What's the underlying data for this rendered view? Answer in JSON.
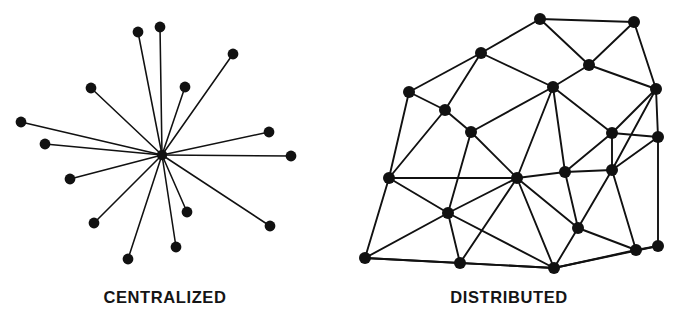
{
  "figure": {
    "background_color": "#ffffff",
    "ink_color": "#111111"
  },
  "panels": [
    {
      "id": "centralized",
      "caption": "CENTRALIZED",
      "type": "star",
      "node_count": 17,
      "edge_count": 16,
      "hub": {
        "x": 162,
        "y": 155,
        "r": 5.2
      },
      "leaf_radius": 5.4,
      "leaves": [
        {
          "x": 138,
          "y": 32
        },
        {
          "x": 160,
          "y": 27
        },
        {
          "x": 233,
          "y": 54
        },
        {
          "x": 185,
          "y": 87
        },
        {
          "x": 91,
          "y": 88
        },
        {
          "x": 269,
          "y": 132
        },
        {
          "x": 21,
          "y": 122
        },
        {
          "x": 45,
          "y": 144
        },
        {
          "x": 291,
          "y": 156
        },
        {
          "x": 70,
          "y": 179
        },
        {
          "x": 94,
          "y": 223
        },
        {
          "x": 187,
          "y": 212
        },
        {
          "x": 270,
          "y": 226
        },
        {
          "x": 128,
          "y": 259
        },
        {
          "x": 176,
          "y": 247
        }
      ]
    },
    {
      "id": "distributed",
      "caption": "DISTRIBUTED",
      "type": "mesh",
      "node_count": 26,
      "edge_count": 57,
      "node_radius": 6.0,
      "nodes": [
        {
          "id": 0,
          "x": 202,
          "y": 19
        },
        {
          "id": 1,
          "x": 296,
          "y": 22
        },
        {
          "id": 2,
          "x": 143,
          "y": 53
        },
        {
          "id": 3,
          "x": 251,
          "y": 65
        },
        {
          "id": 4,
          "x": 71,
          "y": 92
        },
        {
          "id": 5,
          "x": 215,
          "y": 87
        },
        {
          "id": 6,
          "x": 318,
          "y": 89
        },
        {
          "id": 7,
          "x": 107,
          "y": 110
        },
        {
          "id": 8,
          "x": 133,
          "y": 132
        },
        {
          "id": 9,
          "x": 320,
          "y": 137
        },
        {
          "id": 10,
          "x": 274,
          "y": 133
        },
        {
          "id": 11,
          "x": 51,
          "y": 178
        },
        {
          "id": 12,
          "x": 179,
          "y": 178
        },
        {
          "id": 13,
          "x": 227,
          "y": 172
        },
        {
          "id": 14,
          "x": 274,
          "y": 170
        },
        {
          "id": 15,
          "x": 110,
          "y": 213
        },
        {
          "id": 16,
          "x": 240,
          "y": 228
        },
        {
          "id": 17,
          "x": 27,
          "y": 258
        },
        {
          "id": 18,
          "x": 122,
          "y": 263
        },
        {
          "id": 19,
          "x": 216,
          "y": 268
        },
        {
          "id": 20,
          "x": 298,
          "y": 250
        },
        {
          "id": 21,
          "x": 320,
          "y": 246
        }
      ],
      "edges": [
        [
          0,
          1
        ],
        [
          0,
          2
        ],
        [
          0,
          3
        ],
        [
          1,
          3
        ],
        [
          1,
          6
        ],
        [
          2,
          4
        ],
        [
          2,
          5
        ],
        [
          2,
          7
        ],
        [
          3,
          5
        ],
        [
          3,
          6
        ],
        [
          4,
          7
        ],
        [
          4,
          11
        ],
        [
          5,
          10
        ],
        [
          5,
          12
        ],
        [
          5,
          8
        ],
        [
          6,
          9
        ],
        [
          6,
          10
        ],
        [
          6,
          14
        ],
        [
          7,
          8
        ],
        [
          7,
          11
        ],
        [
          8,
          12
        ],
        [
          8,
          15
        ],
        [
          9,
          14
        ],
        [
          9,
          21
        ],
        [
          10,
          13
        ],
        [
          10,
          14
        ],
        [
          11,
          12
        ],
        [
          11,
          15
        ],
        [
          11,
          17
        ],
        [
          12,
          13
        ],
        [
          12,
          15
        ],
        [
          12,
          16
        ],
        [
          12,
          19
        ],
        [
          13,
          14
        ],
        [
          13,
          16
        ],
        [
          14,
          16
        ],
        [
          14,
          20
        ],
        [
          15,
          17
        ],
        [
          15,
          18
        ],
        [
          15,
          19
        ],
        [
          16,
          19
        ],
        [
          16,
          20
        ],
        [
          17,
          18
        ],
        [
          18,
          19
        ],
        [
          19,
          20
        ],
        [
          20,
          21
        ],
        [
          9,
          10
        ],
        [
          5,
          13
        ],
        [
          12,
          18
        ],
        [
          17,
          19
        ],
        [
          19,
          21
        ]
      ]
    }
  ]
}
